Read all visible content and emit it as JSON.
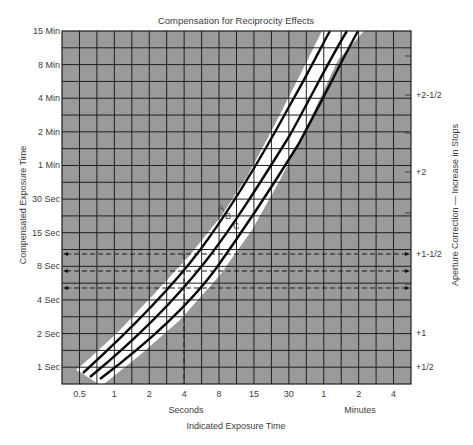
{
  "title": "Compensation for Reciprocity Effects",
  "colors": {
    "grid_fill": "#9a9a9a",
    "grid_line": "#1e1e1e",
    "band": "#ffffff",
    "curve": "#0a0a0a",
    "text": "#3c3c3c"
  },
  "chart_data": {
    "type": "line",
    "title": "Compensation for Reciprocity Effects",
    "xlabel": "Indicated Exposure Time",
    "ylabel": "Compensated Exposure Time",
    "y2label": "Aperture Correction — Increase in Stops",
    "x_scale": "log",
    "y_scale": "log",
    "x_tick_labels": [
      "0.5",
      "1",
      "2",
      "4",
      "8",
      "15",
      "30",
      "1",
      "2",
      "4"
    ],
    "x_tick_seconds": [
      0.5,
      1,
      2,
      4,
      8,
      15,
      30,
      60,
      120,
      240
    ],
    "x_unit_labels": {
      "seconds": "Seconds",
      "minutes": "Minutes"
    },
    "y_tick_labels": [
      "15 Min",
      "8 Min",
      "4 Min",
      "2 Min",
      "1 Min",
      "30 Sec",
      "15 Sec",
      "8 Sec",
      "4 Sec",
      "2 Sec",
      "1 Sec"
    ],
    "y_tick_seconds": [
      900,
      480,
      240,
      120,
      60,
      30,
      15,
      8,
      4,
      2,
      1
    ],
    "y2_tick_labels": [
      "+2-1/2",
      "+2",
      "+1-1/2",
      "+1",
      "+1/2"
    ],
    "grid": true,
    "series": [
      {
        "name": "A",
        "x": [
          0.55,
          1,
          2,
          4,
          8,
          15,
          30,
          60,
          90
        ],
        "y": [
          1,
          1.9,
          4.6,
          11,
          28,
          70,
          190,
          520,
          900
        ]
      },
      {
        "name": "B",
        "x": [
          0.65,
          1,
          2,
          4,
          8,
          15,
          30,
          60,
          120
        ],
        "y": [
          0.95,
          1.5,
          3.7,
          8.5,
          22,
          52,
          140,
          390,
          900
        ]
      },
      {
        "name": "C",
        "x": [
          0.8,
          1,
          2,
          4,
          8,
          15,
          30,
          60,
          120,
          150
        ],
        "y": [
          0.92,
          1.15,
          2.6,
          5.8,
          15,
          36,
          95,
          260,
          720,
          900
        ]
      }
    ],
    "reference_lines": {
      "vertical_x": 4,
      "horizontal_y": [
        11,
        8.5,
        5.8
      ],
      "aperture_stops": [
        "+1-1/2",
        "+1-1/4",
        "+1"
      ]
    },
    "annotations": [
      "A",
      "B",
      "C"
    ]
  },
  "labels": {
    "y_axis": "Compensated Exposure Time",
    "y2_axis": "Aperture Correction — Increase in Stops",
    "x_axis": "Indicated Exposure Time",
    "seconds": "Seconds",
    "minutes": "Minutes",
    "curve_a": "A",
    "curve_b": "B",
    "curve_c": "C"
  }
}
